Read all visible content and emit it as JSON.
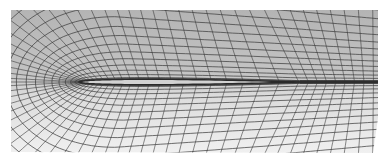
{
  "figure": {
    "type": "structured-c-mesh-around-airfoil",
    "caption": "",
    "colors": {
      "background": "#ffffff",
      "mesh_line": "#3a3a3a",
      "mesh_fill_upper": "#b8b8b8",
      "mesh_fill_lower": "#e6e6e6",
      "airfoil_fill": "#d2d2d2",
      "airfoil_outline": "#2a2a2a",
      "wake_line": "#2e2e2e"
    },
    "domain_bounds": {
      "x0": 11,
      "y0": 10,
      "x1": 378,
      "y1": 152
    },
    "airfoil": {
      "leading_edge": [
        80,
        82
      ],
      "trailing_edge": [
        300,
        82
      ],
      "max_thickness_y": [
        69,
        96
      ]
    },
    "wake": {
      "from": [
        300,
        82
      ],
      "to": [
        378,
        82
      ]
    },
    "grid": {
      "radial_lines": 72,
      "wrap_lines": 14
    }
  }
}
